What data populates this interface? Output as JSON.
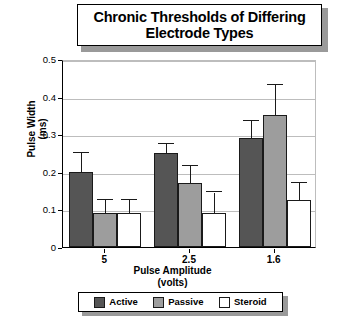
{
  "chart_data": {
    "type": "bar",
    "title": "Chronic Thresholds of Differing Electrode Types",
    "title_line1": "Chronic Thresholds of Differing",
    "title_line2": "Electrode Types",
    "xlabel": "Pulse Amplitude",
    "xlabel_line2": "(volts)",
    "ylabel": "Pulse Width",
    "ylabel_line2": "(ms)",
    "ylim": [
      0,
      0.5
    ],
    "ytick_labels": [
      "0.5",
      "0.4",
      "0.3",
      "0.2",
      "0.1",
      "0"
    ],
    "ytick_values": [
      0.5,
      0.4,
      0.3,
      0.2,
      0.1,
      0
    ],
    "grid": true,
    "legend_position": "bottom",
    "categories": [
      "5",
      "2.5",
      "1.6"
    ],
    "series": [
      {
        "name": "Active",
        "color": "#555555",
        "values": [
          0.2,
          0.25,
          0.29
        ],
        "errors_upper": [
          0.25,
          0.275,
          0.335
        ]
      },
      {
        "name": "Passive",
        "color": "#9d9d9d",
        "values": [
          0.09,
          0.17,
          0.35
        ],
        "errors_upper": [
          0.125,
          0.215,
          0.43
        ]
      },
      {
        "name": "Steroid",
        "color": "#ffffff",
        "values": [
          0.09,
          0.09,
          0.125
        ],
        "errors_upper": [
          0.125,
          0.145,
          0.17
        ]
      }
    ]
  },
  "legend": {
    "items": [
      {
        "label": "Active"
      },
      {
        "label": "Passive"
      },
      {
        "label": "Steroid"
      }
    ]
  }
}
